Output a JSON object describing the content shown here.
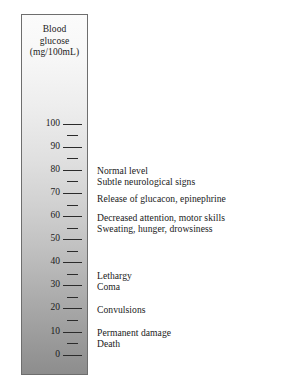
{
  "figure": {
    "name": "blood-glucose-scale-diagram",
    "axis_title": {
      "line1": "Blood",
      "line2": "glucose",
      "line3": "(mg/100mL)"
    }
  },
  "chart_data": {
    "type": "bar",
    "title": "Blood glucose (mg/100mL)",
    "xlabel": "",
    "ylabel": "Blood glucose (mg/100mL)",
    "ylim": [
      0,
      110
    ],
    "orientation": "vertical",
    "grid": false,
    "legend": "none",
    "gradient": {
      "top_color": "#fbfbfb",
      "bottom_color": "#8d8d8d",
      "description": "vertical gray gradient, light at high glucose, dark at low glucose"
    },
    "major_ticks": [
      100,
      90,
      80,
      70,
      60,
      50,
      40,
      30,
      20,
      10,
      0
    ],
    "major_tick_labels": [
      "100",
      "90",
      "80",
      "70",
      "60",
      "50",
      "40",
      "30",
      "20",
      "10",
      "0"
    ],
    "minor_ticks": [
      95,
      85,
      75,
      65,
      55,
      45,
      35,
      25,
      15,
      5
    ],
    "annotations": [
      {
        "value": 80,
        "text": "Normal level"
      },
      {
        "value": 75,
        "text": "Subtle neurological signs"
      },
      {
        "value": 69,
        "text": "Release of glucagon, epinephrine"
      },
      {
        "value": 61,
        "text": "Decreased attention, motor skills"
      },
      {
        "value": 56,
        "text": "Sweating, hunger, drowsiness"
      },
      {
        "value": 36,
        "text": "Lethargy"
      },
      {
        "value": 31,
        "text": "Coma"
      },
      {
        "value": 21,
        "text": "Convulsions"
      },
      {
        "value": 11,
        "text": "Permanent damage"
      },
      {
        "value": 6,
        "text": "Death"
      }
    ]
  },
  "ticks": [
    {
      "label": "100",
      "top": 124,
      "major": true
    },
    {
      "label": "",
      "top": 135,
      "major": false
    },
    {
      "label": "90",
      "top": 147,
      "major": true
    },
    {
      "label": "",
      "top": 158,
      "major": false
    },
    {
      "label": "80",
      "top": 170,
      "major": true
    },
    {
      "label": "",
      "top": 181,
      "major": false
    },
    {
      "label": "70",
      "top": 193,
      "major": true
    },
    {
      "label": "",
      "top": 205,
      "major": false
    },
    {
      "label": "60",
      "top": 216,
      "major": true
    },
    {
      "label": "",
      "top": 228,
      "major": false
    },
    {
      "label": "50",
      "top": 239,
      "major": true
    },
    {
      "label": "",
      "top": 251,
      "major": false
    },
    {
      "label": "40",
      "top": 262,
      "major": true
    },
    {
      "label": "",
      "top": 274,
      "major": false
    },
    {
      "label": "30",
      "top": 285,
      "major": true
    },
    {
      "label": "",
      "top": 297,
      "major": false
    },
    {
      "label": "20",
      "top": 308,
      "major": true
    },
    {
      "label": "",
      "top": 320,
      "major": false
    },
    {
      "label": "10",
      "top": 332,
      "major": true
    },
    {
      "label": "",
      "top": 343,
      "major": false
    },
    {
      "label": "0",
      "top": 355,
      "major": true
    }
  ],
  "annotations": [
    {
      "text": "Normal level",
      "top": 165
    },
    {
      "text": "Subtle neurological signs",
      "top": 176
    },
    {
      "text": "Release of glucacon, epinephrine",
      "top": 193
    },
    {
      "text": "Decreased attention, motor skills",
      "top": 212
    },
    {
      "text": "Sweating, hunger, drowsiness",
      "top": 223
    },
    {
      "text": "Lethargy",
      "top": 270
    },
    {
      "text": "Coma",
      "top": 281
    },
    {
      "text": "Convulsions",
      "top": 304
    },
    {
      "text": "Permanent damage",
      "top": 327
    },
    {
      "text": "Death",
      "top": 338
    }
  ]
}
